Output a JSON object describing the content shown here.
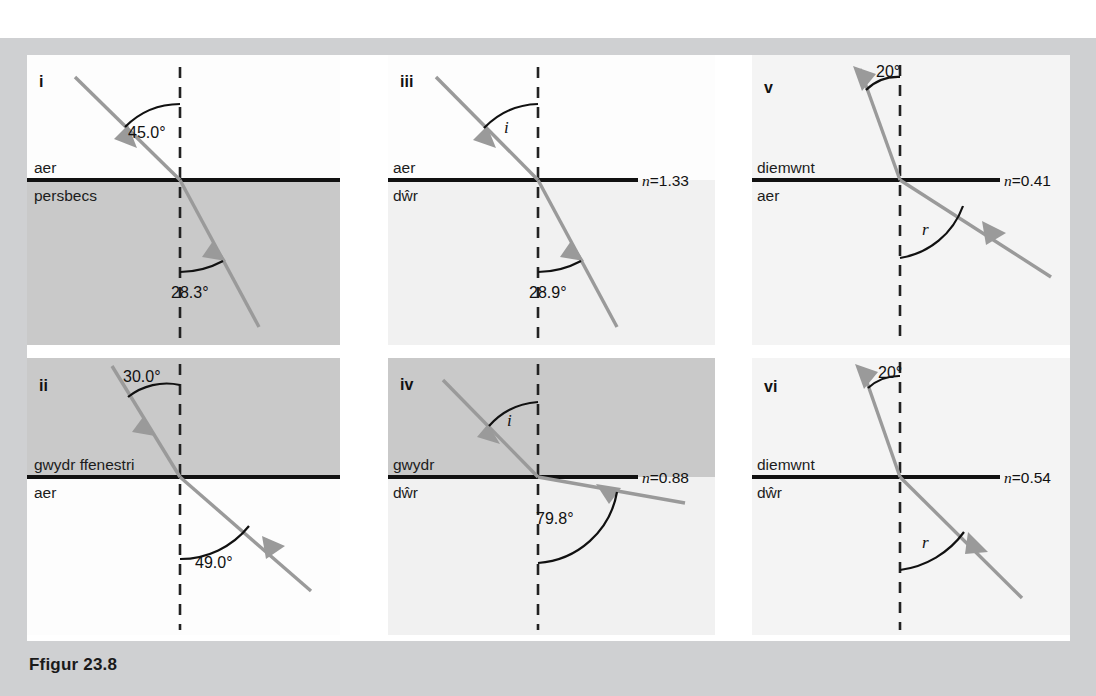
{
  "figure": {
    "caption": "Ffigur 23.8",
    "page_bg": "#cfd0d2",
    "sheet_bg": "#ffffff",
    "ray_color": "#9a9a9a",
    "boundary_color": "#111111",
    "normal_color": "#222222",
    "shade_dark": "#c9c9c9",
    "shade_light": "#f1f1f1"
  },
  "panels": [
    {
      "id": "i",
      "label": "i",
      "upper_medium": "aer",
      "lower_medium": "persbecs",
      "upper_shade": "none",
      "lower_shade": "dark",
      "incident_angle": "45.0°",
      "refracted_angle": "28.3°",
      "incident_angle_value": 45.0,
      "refracted_angle_value": 28.3,
      "n_label": "",
      "n_value": null
    },
    {
      "id": "ii",
      "label": "ii",
      "upper_medium": "gwydr ffenestri",
      "lower_medium": "aer",
      "upper_shade": "dark",
      "lower_shade": "none",
      "incident_angle": "30.0°",
      "refracted_angle": "49.0°",
      "incident_angle_value": 30.0,
      "refracted_angle_value": 49.0,
      "n_label": "",
      "n_value": null
    },
    {
      "id": "iii",
      "label": "iii",
      "upper_medium": "aer",
      "lower_medium": "dŵr",
      "upper_shade": "none",
      "lower_shade": "light",
      "incident_angle": "i",
      "refracted_angle": "28.9°",
      "incident_angle_value": null,
      "refracted_angle_value": 28.9,
      "n_label": "n",
      "n_value": "1.33"
    },
    {
      "id": "iv",
      "label": "iv",
      "upper_medium": "gwydr",
      "lower_medium": "dŵr",
      "upper_shade": "dark",
      "lower_shade": "light",
      "incident_angle": "i",
      "refracted_angle": "79.8°",
      "incident_angle_value": null,
      "refracted_angle_value": 79.8,
      "n_label": "n",
      "n_value": "0.88"
    },
    {
      "id": "v",
      "label": "v",
      "upper_medium": "diemwnt",
      "lower_medium": "aer",
      "upper_shade": "light",
      "lower_shade": "light",
      "incident_angle": "20°",
      "refracted_angle": "r",
      "incident_angle_value": 20,
      "refracted_angle_value": null,
      "n_label": "n",
      "n_value": "0.41"
    },
    {
      "id": "vi",
      "label": "vi",
      "upper_medium": "diemwnt",
      "lower_medium": "dŵr",
      "upper_shade": "light",
      "lower_shade": "light",
      "incident_angle": "20°",
      "refracted_angle": "r",
      "incident_angle_value": 20,
      "refracted_angle_value": null,
      "n_label": "n",
      "n_value": "0.54"
    }
  ]
}
